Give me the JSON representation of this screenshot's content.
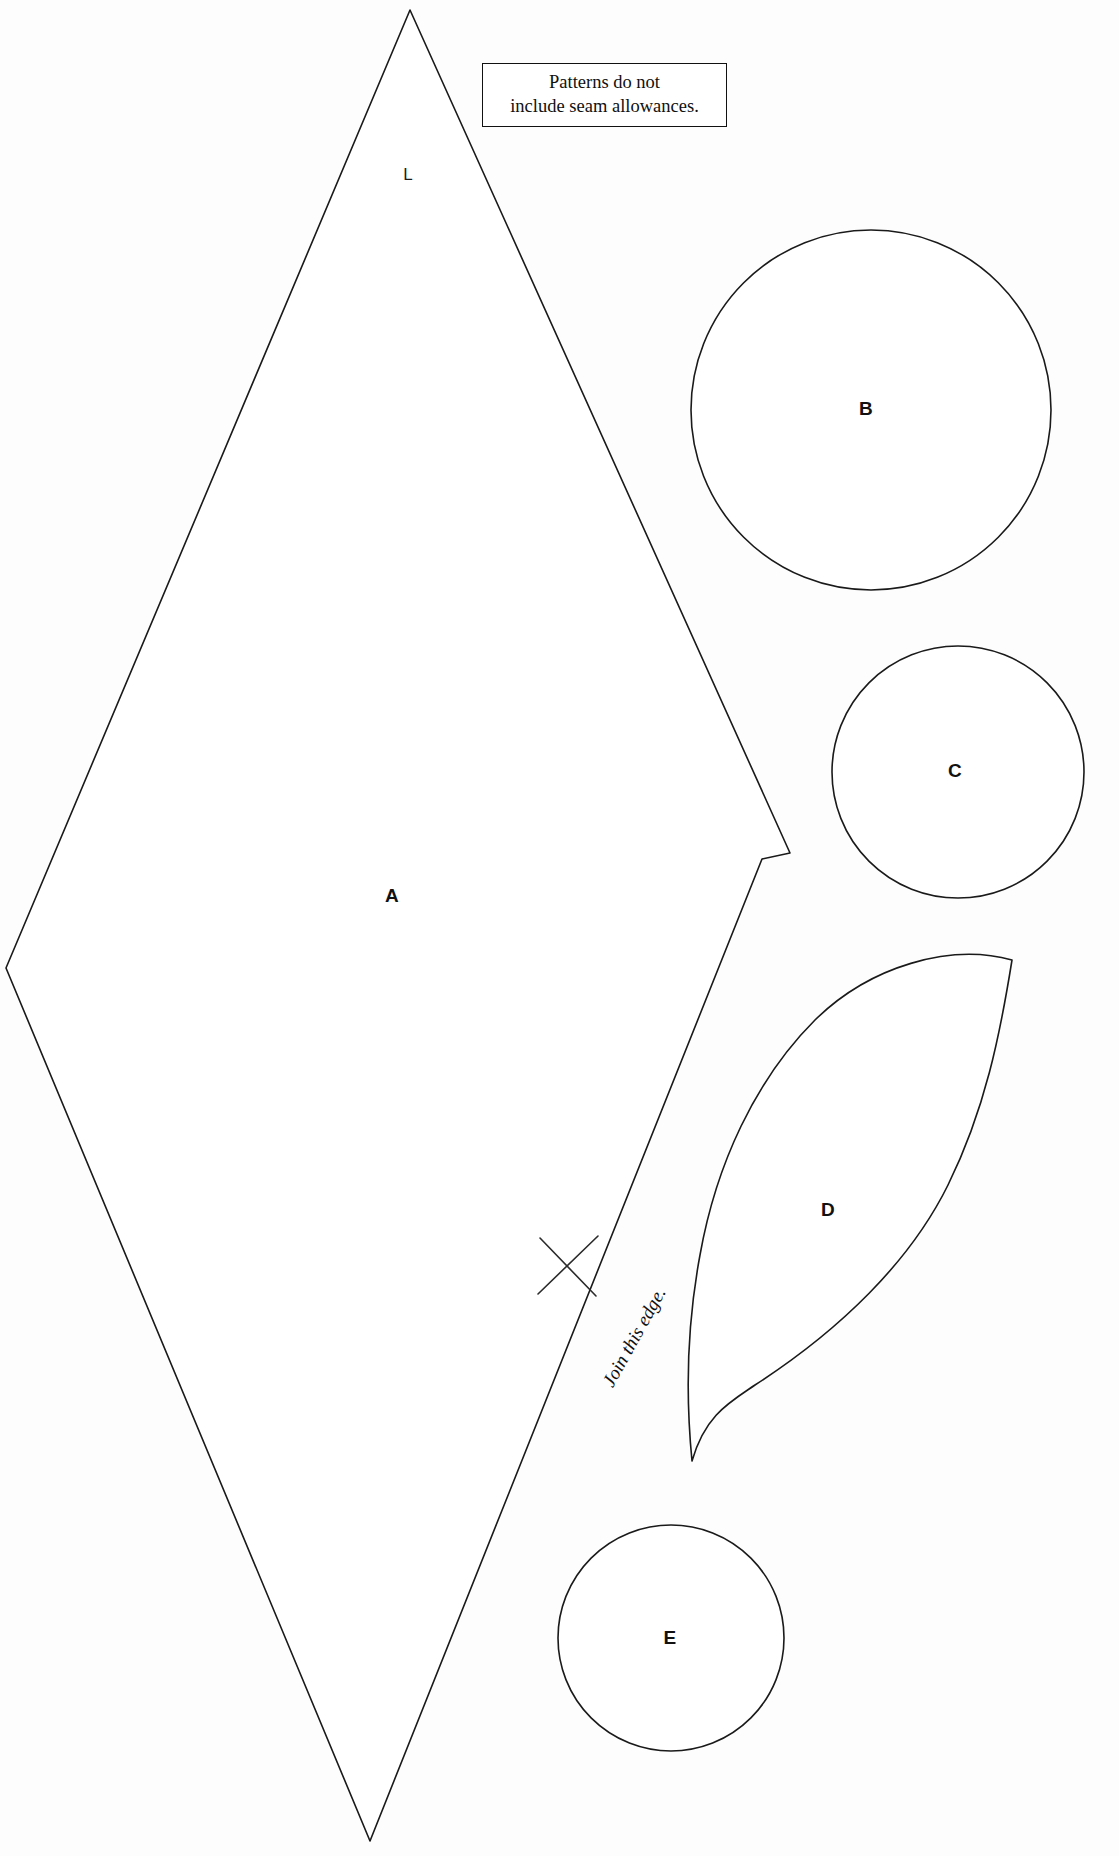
{
  "sheet": {
    "title": "Sewing pattern pieces sheet",
    "background_color": "#fdfdfd",
    "line_color": "#1a1a1a",
    "width": 1119,
    "height": 1856
  },
  "note_box": {
    "line1": "Patterns do not",
    "line2": "include seam allowances."
  },
  "pieces": [
    {
      "id": "A",
      "label": "A",
      "shape": "diamond-kite",
      "label_x": 392,
      "label_y": 896
    },
    {
      "id": "B",
      "label": "B",
      "shape": "circle",
      "label_x": 866,
      "label_y": 409
    },
    {
      "id": "C",
      "label": "C",
      "shape": "circle",
      "label_x": 955,
      "label_y": 771
    },
    {
      "id": "D",
      "label": "D",
      "shape": "leaf",
      "label_x": 828,
      "label_y": 1210
    },
    {
      "id": "E",
      "label": "E",
      "shape": "circle",
      "label_x": 670,
      "label_y": 1638
    }
  ],
  "marks": {
    "grain_label": "L",
    "grain_label_x": 408,
    "grain_label_y": 175,
    "join_edge_text": "Join this edge.",
    "cross_mark_name": "x-notch-mark"
  }
}
